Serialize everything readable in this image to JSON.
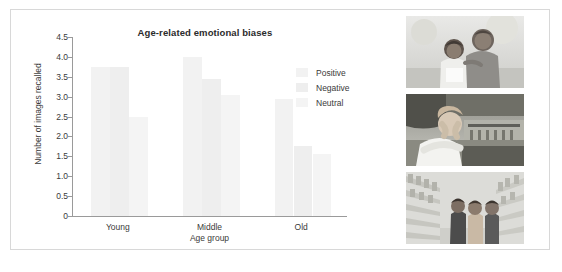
{
  "figure": {
    "background_color": "#ffffff",
    "frame_color": "#d8d8d8"
  },
  "chart_data": {
    "type": "bar",
    "title": "Age-related emotional biases",
    "xlabel": "Age group",
    "ylabel": "Number of images recalled",
    "categories": [
      "Young",
      "Middle",
      "Old"
    ],
    "series": [
      {
        "name": "Positive",
        "values": [
          3.75,
          4.0,
          2.95
        ],
        "color": "#f2f2f2"
      },
      {
        "name": "Negative",
        "values": [
          3.75,
          3.45,
          1.75
        ],
        "color": "#eeeeee"
      },
      {
        "name": "Neutral",
        "values": [
          2.5,
          3.05,
          1.55
        ],
        "color": "#f4f4f4"
      }
    ],
    "ylim": [
      0,
      4.5
    ],
    "ytick_labels": [
      "4.5",
      "4.0",
      "3.5",
      "3.0",
      "2.5",
      "2.0",
      "1.5",
      "1.0",
      "0.5",
      "0"
    ],
    "ytick_values": [
      4.5,
      4.0,
      3.5,
      3.0,
      2.5,
      2.0,
      1.5,
      1.0,
      0.5,
      0
    ],
    "grid": false,
    "legend_position": "right"
  },
  "legend": {
    "items": [
      {
        "label": "Positive"
      },
      {
        "label": "Negative"
      },
      {
        "label": "Neutral"
      }
    ]
  },
  "photos": [
    {
      "caption": "positive-photo-grandfather-and-child-smiling"
    },
    {
      "caption": "negative-photo-distressed-person-hands-to-face"
    },
    {
      "caption": "neutral-photo-family-in-supermarket-aisle"
    }
  ]
}
